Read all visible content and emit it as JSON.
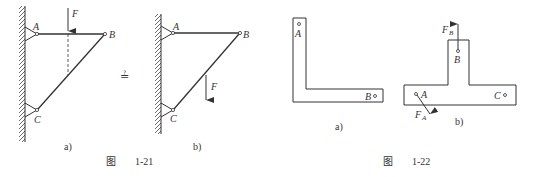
{
  "figure_1_21": {
    "caption_prefix": "图",
    "caption_number": "1-21",
    "question_symbol": "≟",
    "panel_a": {
      "label": "a)",
      "points": {
        "A": "A",
        "B": "B",
        "C": "C"
      },
      "force": "F"
    },
    "panel_b": {
      "label": "b)",
      "points": {
        "A": "A",
        "B": "B",
        "C": "C"
      },
      "force": "F"
    }
  },
  "figure_1_22": {
    "caption_prefix": "图",
    "caption_number": "1-22",
    "panel_a": {
      "label": "a)",
      "points": {
        "A": "A",
        "B": "B"
      }
    },
    "panel_b": {
      "label": "b)",
      "points": {
        "A": "A",
        "B": "B",
        "C": "C"
      },
      "forces": {
        "FA": "F",
        "FA_sub": "A",
        "FB": "F",
        "FB_sub": "B"
      }
    }
  },
  "colors": {
    "line": "#333333",
    "background": "#ffffff"
  }
}
